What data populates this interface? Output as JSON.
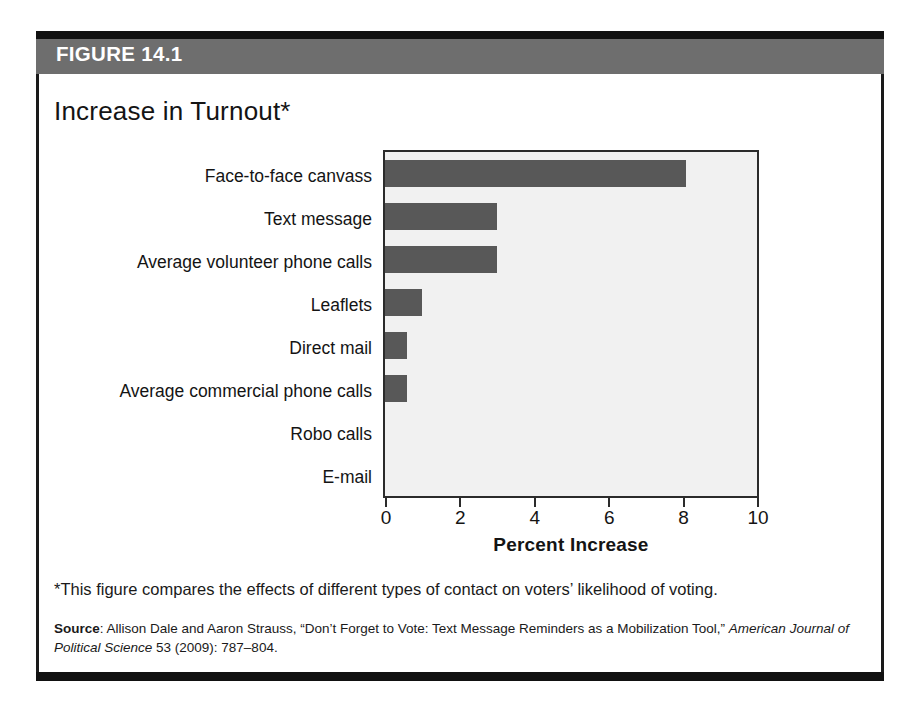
{
  "figure": {
    "header_label": "FIGURE 14.1",
    "title": "Increase in Turnout*",
    "footnote": "*This figure compares the effects of different types of contact on voters’ likelihood of voting.",
    "source_label": "Source",
    "source_separator": ": ",
    "source_text": "Allison Dale and Aaron Strauss, “Don’t Forget to Vote: Text Message Reminders as a Mobilization Tool,” ",
    "source_journal": "American Journal of Political Science",
    "source_citation": " 53 (2009): 787–804."
  },
  "colors": {
    "header_band": "#6e6e6e",
    "frame": "#111111",
    "bar_fill": "#585858",
    "plot_background": "#f1f1f1",
    "axis": "#2b2b2b",
    "text": "#141414"
  },
  "chart_data": {
    "type": "bar",
    "orientation": "horizontal",
    "title": "Increase in Turnout*",
    "xlabel": "Percent Increase",
    "ylabel": "",
    "xlim": [
      0,
      10
    ],
    "xticks": [
      0,
      2,
      4,
      6,
      8,
      10
    ],
    "xtick_labels": [
      "0",
      "2",
      "4",
      "6",
      "8",
      "10"
    ],
    "grid": false,
    "legend": false,
    "categories": [
      "Face-to-face canvass",
      "Text message",
      "Average volunteer phone calls",
      "Leaflets",
      "Direct mail",
      "Average commercial phone calls",
      "Robo calls",
      "E-mail"
    ],
    "values": [
      8.1,
      3.0,
      3.0,
      1.0,
      0.6,
      0.6,
      0.0,
      0.0
    ],
    "series": [
      {
        "name": "Percent Increase",
        "values": [
          8.1,
          3.0,
          3.0,
          1.0,
          0.6,
          0.6,
          0.0,
          0.0
        ]
      }
    ]
  }
}
